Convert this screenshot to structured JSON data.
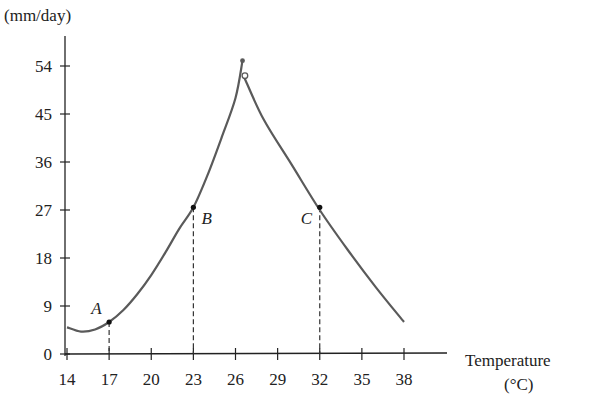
{
  "chart_data": {
    "type": "line",
    "title": "",
    "ylabel": "(mm/day)",
    "xlabel": "Temperature (°C)",
    "xlabel_line1": "Temperature",
    "xlabel_line2": "(°C)",
    "x_ticks": [
      14,
      17,
      20,
      23,
      26,
      29,
      32,
      35,
      38
    ],
    "y_ticks": [
      0,
      9,
      18,
      27,
      36,
      45,
      54
    ],
    "xlim": [
      14,
      40
    ],
    "ylim": [
      0,
      60
    ],
    "grid": false,
    "series": [
      {
        "name": "rising branch",
        "x": [
          14,
          15,
          16,
          17,
          18,
          19,
          20,
          21,
          22,
          23,
          24,
          25,
          26,
          26.5
        ],
        "y": [
          5,
          4.2,
          4.6,
          6,
          8.2,
          11.2,
          14.8,
          19,
          23.5,
          27.5,
          33.5,
          40.5,
          48,
          55
        ]
      },
      {
        "name": "falling branch",
        "x": [
          26.6,
          28,
          30,
          32,
          34,
          36,
          38
        ],
        "y": [
          52,
          44,
          35.5,
          27,
          19.5,
          12.5,
          6
        ]
      }
    ],
    "points": [
      {
        "label": "A",
        "x": 17,
        "y": 6,
        "dashed_drop": true
      },
      {
        "label": "B",
        "x": 23,
        "y": 27.5,
        "dashed_drop": true
      },
      {
        "label": "C",
        "x": 32,
        "y": 27.5,
        "dashed_drop": true
      }
    ],
    "endpoints": [
      {
        "x": 26.5,
        "y": 55,
        "style": "filled"
      },
      {
        "x": 26.6,
        "y": 52,
        "style": "open"
      }
    ],
    "colors": {
      "curve": "#5a5a5a",
      "axis": "#222222",
      "text": "#222222"
    }
  }
}
